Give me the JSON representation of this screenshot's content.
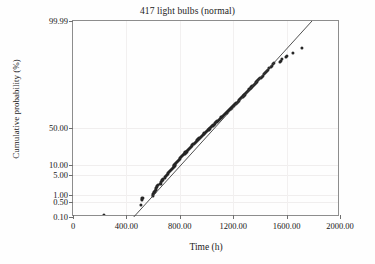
{
  "chart_data": {
    "type": "scatter",
    "title": "417 light bulbs (normal)",
    "xlabel": "Time (h)",
    "ylabel": "Cumulative probability (%)",
    "plot_kind": "normal-probability-plot",
    "grid": true,
    "legend": "none",
    "xlim": [
      0,
      2000
    ],
    "ylim_percent": [
      0.1,
      99.99
    ],
    "xticks": [
      0,
      400,
      800,
      1200,
      1600,
      2000
    ],
    "xtick_labels": [
      "0",
      "400.00",
      "800.00",
      "1200.00",
      "1600.00",
      "2000.00"
    ],
    "yticks_percent": [
      0.1,
      0.5,
      1,
      5,
      10,
      50,
      99.99
    ],
    "ytick_labels": [
      "0.10",
      "0.50",
      "1.00",
      "5.00",
      "10.00",
      "50.00",
      "99.99"
    ],
    "marker": {
      "shape": "circle",
      "color": "#262626",
      "size_px": 3
    },
    "fit_line": {
      "color": "#3d3d3d",
      "x_start": 455,
      "y_start_percent": 0.1,
      "x_end": 1790,
      "y_end_percent": 99.99
    },
    "n_points": 417,
    "points": [
      [
        230,
        0.13
      ],
      [
        510,
        0.38
      ],
      [
        515,
        0.62
      ],
      [
        518,
        0.72
      ],
      [
        521,
        0.78
      ],
      [
        598,
        0.95
      ],
      [
        602,
        1.05
      ],
      [
        606,
        1.18
      ],
      [
        610,
        1.32
      ],
      [
        614,
        1.45
      ],
      [
        620,
        1.62
      ],
      [
        624,
        1.8
      ],
      [
        628,
        2.0
      ],
      [
        632,
        2.2
      ],
      [
        636,
        2.4
      ],
      [
        655,
        2.7
      ],
      [
        660,
        3.0
      ],
      [
        665,
        3.3
      ],
      [
        670,
        3.6
      ],
      [
        676,
        3.9
      ],
      [
        690,
        4.3
      ],
      [
        696,
        4.7
      ],
      [
        702,
        5.1
      ],
      [
        708,
        5.5
      ],
      [
        714,
        5.9
      ],
      [
        722,
        6.4
      ],
      [
        728,
        6.9
      ],
      [
        734,
        7.4
      ],
      [
        740,
        7.9
      ],
      [
        746,
        8.5
      ],
      [
        754,
        9.1
      ],
      [
        760,
        9.7
      ],
      [
        766,
        10.3
      ],
      [
        772,
        11.0
      ],
      [
        778,
        11.7
      ],
      [
        786,
        12.4
      ],
      [
        792,
        13.1
      ],
      [
        798,
        13.9
      ],
      [
        804,
        14.7
      ],
      [
        810,
        15.5
      ],
      [
        818,
        16.3
      ],
      [
        824,
        17.1
      ],
      [
        830,
        18.0
      ],
      [
        836,
        18.9
      ],
      [
        842,
        19.8
      ],
      [
        850,
        20.7
      ],
      [
        856,
        21.6
      ],
      [
        862,
        22.5
      ],
      [
        868,
        23.5
      ],
      [
        874,
        24.5
      ],
      [
        882,
        25.5
      ],
      [
        888,
        26.5
      ],
      [
        894,
        27.5
      ],
      [
        900,
        28.5
      ],
      [
        906,
        29.5
      ],
      [
        914,
        30.5
      ],
      [
        920,
        31.5
      ],
      [
        926,
        32.6
      ],
      [
        932,
        33.7
      ],
      [
        938,
        34.8
      ],
      [
        946,
        35.9
      ],
      [
        952,
        37.0
      ],
      [
        958,
        38.1
      ],
      [
        964,
        39.2
      ],
      [
        970,
        40.3
      ],
      [
        978,
        41.4
      ],
      [
        984,
        42.5
      ],
      [
        990,
        43.6
      ],
      [
        996,
        44.7
      ],
      [
        1002,
        45.8
      ],
      [
        1010,
        47.0
      ],
      [
        1016,
        48.1
      ],
      [
        1022,
        49.2
      ],
      [
        1028,
        50.3
      ],
      [
        1034,
        51.4
      ],
      [
        1042,
        52.5
      ],
      [
        1048,
        53.6
      ],
      [
        1054,
        54.7
      ],
      [
        1060,
        55.8
      ],
      [
        1066,
        56.9
      ],
      [
        1074,
        58.0
      ],
      [
        1080,
        59.1
      ],
      [
        1086,
        60.2
      ],
      [
        1092,
        61.3
      ],
      [
        1098,
        62.4
      ],
      [
        1106,
        63.4
      ],
      [
        1112,
        64.5
      ],
      [
        1118,
        65.5
      ],
      [
        1124,
        66.5
      ],
      [
        1130,
        67.5
      ],
      [
        1138,
        68.5
      ],
      [
        1144,
        69.5
      ],
      [
        1150,
        70.5
      ],
      [
        1156,
        71.5
      ],
      [
        1162,
        72.4
      ],
      [
        1170,
        73.4
      ],
      [
        1176,
        74.3
      ],
      [
        1182,
        75.2
      ],
      [
        1188,
        76.1
      ],
      [
        1194,
        77.0
      ],
      [
        1202,
        77.9
      ],
      [
        1208,
        78.8
      ],
      [
        1214,
        79.6
      ],
      [
        1220,
        80.4
      ],
      [
        1226,
        81.2
      ],
      [
        1234,
        82.0
      ],
      [
        1240,
        82.8
      ],
      [
        1246,
        83.6
      ],
      [
        1252,
        84.3
      ],
      [
        1258,
        85.0
      ],
      [
        1266,
        85.7
      ],
      [
        1272,
        86.4
      ],
      [
        1278,
        87.1
      ],
      [
        1284,
        87.7
      ],
      [
        1290,
        88.3
      ],
      [
        1298,
        88.9
      ],
      [
        1304,
        89.5
      ],
      [
        1310,
        90.1
      ],
      [
        1316,
        90.6
      ],
      [
        1322,
        91.1
      ],
      [
        1330,
        91.6
      ],
      [
        1336,
        92.1
      ],
      [
        1342,
        92.6
      ],
      [
        1348,
        93.0
      ],
      [
        1354,
        93.4
      ],
      [
        1362,
        93.8
      ],
      [
        1368,
        94.2
      ],
      [
        1374,
        94.6
      ],
      [
        1380,
        95.0
      ],
      [
        1386,
        95.3
      ],
      [
        1396,
        95.7
      ],
      [
        1404,
        96.0
      ],
      [
        1412,
        96.3
      ],
      [
        1420,
        96.6
      ],
      [
        1428,
        96.9
      ],
      [
        1438,
        97.2
      ],
      [
        1446,
        97.45
      ],
      [
        1454,
        97.7
      ],
      [
        1462,
        97.9
      ],
      [
        1470,
        98.1
      ],
      [
        1480,
        98.3
      ],
      [
        1488,
        98.5
      ],
      [
        1496,
        98.65
      ],
      [
        1504,
        98.8
      ],
      [
        1548,
        98.95
      ],
      [
        1556,
        99.05
      ],
      [
        1562,
        99.15
      ],
      [
        1596,
        99.3
      ],
      [
        1604,
        99.38
      ],
      [
        1648,
        99.55
      ],
      [
        1712,
        99.72
      ]
    ]
  }
}
